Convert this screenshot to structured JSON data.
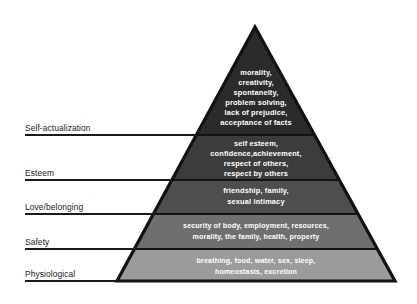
{
  "diagram": {
    "type": "pyramid",
    "background_color": "#ffffff",
    "outline_color": "#111111",
    "label_color": "#1a1a1a",
    "tier_text_color": "#ffffff",
    "apex": {
      "x": 255,
      "y": 27
    },
    "base_left": {
      "x": 117,
      "y": 281
    },
    "base_right": {
      "x": 395,
      "y": 281
    }
  },
  "tiers": [
    {
      "id": "self-actualization",
      "label": "Self-actualization",
      "fill": "#2b2b2b",
      "divider_y": 135,
      "label_line_y": 135,
      "label_text_y": 131,
      "content_lines": [
        "morality,",
        "creativity,",
        "spontaneity,",
        "problem solving,",
        "lack of prejudice,",
        "acceptance of facts"
      ]
    },
    {
      "id": "esteem",
      "label": "Esteem",
      "fill": "#3c3c3c",
      "divider_y": 180,
      "label_line_y": 180,
      "label_text_y": 176,
      "content_lines": [
        "self esteem,",
        "confidence,achievement,",
        "respect of others,",
        "respect by others"
      ]
    },
    {
      "id": "love-belonging",
      "label": "Love/belonging",
      "fill": "#4e4e4e",
      "divider_y": 214,
      "label_line_y": 214,
      "label_text_y": 210,
      "content_lines": [
        "friendship, family,",
        "sexual intimacy"
      ]
    },
    {
      "id": "safety",
      "label": "Safety",
      "fill": "#6f6f6f",
      "divider_y": 249,
      "label_line_y": 249,
      "label_text_y": 245,
      "content_lines": [
        "security of body, employment, resources,",
        "morality, the family, health, property"
      ]
    },
    {
      "id": "physiological",
      "label": "Physiological",
      "fill": "#9b9b9b",
      "divider_y": 281,
      "label_line_y": 281,
      "label_text_y": 277,
      "content_lines": [
        "breathing, food, water, sex, sleep,",
        "homeostasis, excretion"
      ]
    }
  ]
}
